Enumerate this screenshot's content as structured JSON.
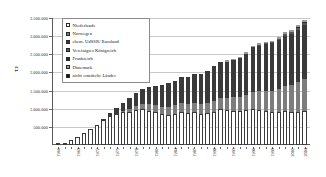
{
  "chart_data": {
    "type": "bar",
    "stacked": true,
    "title": "",
    "xlabel": "",
    "ylabel": "TJ",
    "ylim": [
      0,
      3500000
    ],
    "yticks": [
      500000,
      1000000,
      1500000,
      2000000,
      2500000,
      3000000,
      3500000
    ],
    "ytick_labels": [
      "500.000",
      "1.000.000",
      "1.500.000",
      "2.000.000",
      "2.500.000",
      "3.000.000",
      "3.500.000"
    ],
    "grid": true,
    "legend_position": "top-left",
    "categories": [
      "1966",
      "1967",
      "1968",
      "1969",
      "1970",
      "1971",
      "1972",
      "1973",
      "1974",
      "1975",
      "1976",
      "1977",
      "1978",
      "1979",
      "1980",
      "1981",
      "1982",
      "1983",
      "1984",
      "1985",
      "1986",
      "1987",
      "1988",
      "1989",
      "1990",
      "1991",
      "1992",
      "1993",
      "1994",
      "1995",
      "1996",
      "1997",
      "1998",
      "1999",
      "2000",
      "2001",
      "2002",
      "2003",
      "2004"
    ],
    "xtick_labels": [
      "1966",
      "",
      "",
      "1969",
      "",
      "",
      "1972",
      "",
      "",
      "1975",
      "",
      "",
      "1978",
      "",
      "",
      "1981",
      "",
      "",
      "1984",
      "",
      "",
      "1987",
      "",
      "",
      "1990",
      "",
      "",
      "1993",
      "",
      "",
      "1996",
      "",
      "",
      "1999",
      "",
      "",
      "2002",
      "",
      "2004"
    ],
    "series": [
      {
        "name": "Niederlande",
        "color": "#ffffff",
        "values": [
          20000,
          60000,
          130000,
          230000,
          330000,
          430000,
          560000,
          700000,
          800000,
          860000,
          900000,
          920000,
          960000,
          980000,
          950000,
          900000,
          850000,
          840000,
          860000,
          900000,
          880000,
          900000,
          860000,
          880000,
          920000,
          980000,
          960000,
          950000,
          930000,
          960000,
          1000000,
          960000,
          940000,
          900000,
          900000,
          930000,
          900000,
          920000,
          950000
        ]
      },
      {
        "name": "Norwegen",
        "color": "#7d7d7d",
        "values": [
          0,
          0,
          0,
          0,
          0,
          0,
          0,
          0,
          0,
          0,
          30000,
          80000,
          120000,
          150000,
          180000,
          200000,
          210000,
          220000,
          230000,
          250000,
          260000,
          270000,
          280000,
          290000,
          300000,
          320000,
          340000,
          360000,
          380000,
          420000,
          470000,
          520000,
          560000,
          600000,
          650000,
          700000,
          760000,
          820000,
          880000
        ]
      },
      {
        "name": "ehem. UdSSR/ Russland",
        "color": "#3a3a3a",
        "values": [
          0,
          0,
          0,
          0,
          0,
          0,
          0,
          30000,
          80000,
          150000,
          230000,
          300000,
          360000,
          420000,
          480000,
          540000,
          600000,
          640000,
          680000,
          720000,
          740000,
          780000,
          820000,
          880000,
          950000,
          980000,
          1000000,
          1040000,
          1080000,
          1140000,
          1220000,
          1260000,
          1280000,
          1300000,
          1340000,
          1380000,
          1400000,
          1440000,
          1480000
        ]
      },
      {
        "name": "Vereinigtes Königreich",
        "color": "#565656",
        "values": [
          0,
          0,
          0,
          0,
          0,
          0,
          0,
          0,
          0,
          0,
          0,
          0,
          0,
          0,
          0,
          0,
          0,
          0,
          0,
          0,
          0,
          0,
          0,
          0,
          0,
          0,
          0,
          0,
          0,
          0,
          0,
          10000,
          20000,
          30000,
          40000,
          50000,
          50000,
          50000,
          60000
        ]
      },
      {
        "name": "Frankreich",
        "color": "#2a2a2a",
        "values": [
          0,
          0,
          0,
          0,
          0,
          0,
          0,
          0,
          0,
          0,
          0,
          0,
          0,
          0,
          0,
          0,
          0,
          0,
          0,
          0,
          0,
          0,
          0,
          0,
          0,
          0,
          0,
          0,
          0,
          0,
          0,
          0,
          0,
          0,
          0,
          0,
          10000,
          10000,
          10000
        ]
      },
      {
        "name": "Dänemark",
        "color": "#9a9a9a",
        "values": [
          0,
          0,
          0,
          0,
          0,
          0,
          0,
          0,
          0,
          0,
          0,
          0,
          0,
          0,
          0,
          0,
          0,
          0,
          0,
          0,
          0,
          0,
          0,
          0,
          0,
          20000,
          30000,
          30000,
          40000,
          40000,
          50000,
          50000,
          50000,
          50000,
          50000,
          50000,
          60000,
          60000,
          60000
        ]
      },
      {
        "name": "nicht ermittelte Länder",
        "color": "#151515",
        "values": [
          0,
          0,
          0,
          0,
          0,
          0,
          0,
          0,
          0,
          0,
          0,
          0,
          0,
          0,
          0,
          0,
          0,
          0,
          0,
          0,
          0,
          0,
          0,
          0,
          0,
          0,
          0,
          0,
          0,
          0,
          0,
          0,
          0,
          0,
          0,
          0,
          0,
          0,
          0
        ]
      }
    ]
  }
}
